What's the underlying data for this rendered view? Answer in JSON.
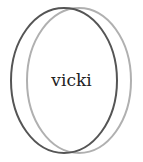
{
  "diagram": {
    "type": "venn",
    "sets": [
      {
        "id": "set-1",
        "label": "vicki",
        "cx": 64,
        "cy": 80.5,
        "rx": 53,
        "ry": 72.5,
        "stroke": "#555555",
        "stroke_width": 2
      },
      {
        "id": "set-2",
        "label": "",
        "cx": 79,
        "cy": 80.5,
        "rx": 52,
        "ry": 72.5,
        "stroke": "#b0b0b0",
        "stroke_width": 2
      }
    ],
    "text_label": {
      "text": "vicki",
      "x": 71.5,
      "y": 86
    }
  }
}
